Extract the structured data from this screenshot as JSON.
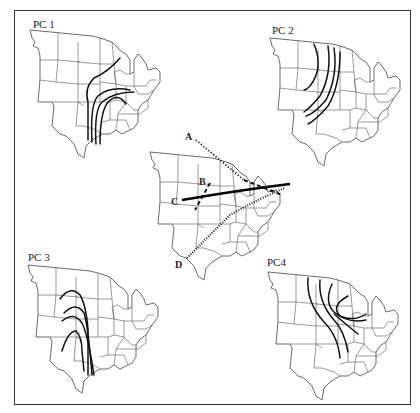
{
  "figure": {
    "panels": [
      {
        "id": "pc1",
        "label": "PC 1"
      },
      {
        "id": "pc2",
        "label": "PC 2"
      },
      {
        "id": "center",
        "label": ""
      },
      {
        "id": "pc3",
        "label": "PC 3"
      },
      {
        "id": "pc4",
        "label": "PC4"
      }
    ],
    "center_transects": [
      {
        "label": "A",
        "style": "dotted"
      },
      {
        "label": "B",
        "style": "dashed"
      },
      {
        "label": "C",
        "style": "solid"
      },
      {
        "label": "D",
        "style": "hatched"
      }
    ]
  },
  "colors": {
    "background": "#ffffff",
    "lines": "#111111",
    "borders": "#555555"
  }
}
